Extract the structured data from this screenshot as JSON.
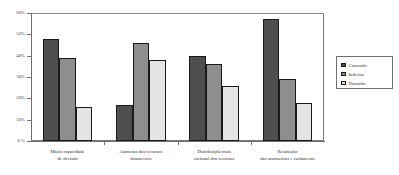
{
  "chart_data": {
    "type": "bar",
    "title": "",
    "xlabel": "",
    "ylabel": "",
    "ylim": [
      0,
      60
    ],
    "ytick_values": [
      0,
      10,
      20,
      30,
      40,
      50,
      60
    ],
    "ytick_labels": [
      "0 %",
      "10%",
      "20%",
      "30%",
      "40%",
      "50%",
      "60%"
    ],
    "grid": false,
    "legend_position": "right",
    "categories": [
      "Maior capacidade\nde decisão",
      "Aumento dos recursos\nfinanceiros",
      "Distribuição mais\nracional dos recursos",
      "Resolução\ndas assimetrias e isolamento"
    ],
    "category_lines": [
      [
        "Maior capacidade",
        "de decisão"
      ],
      [
        "Aumento dos recursos",
        "financeiros"
      ],
      [
        "Distribuição mais",
        "racional dos recursos"
      ],
      [
        "Resolução",
        "das assimetrias e isolamento"
      ]
    ],
    "series": [
      {
        "name": "Concordo",
        "color": "#4e4e4e",
        "values": [
          48,
          17,
          40,
          57
        ]
      },
      {
        "name": "Indeciso",
        "color": "#8e8e8e",
        "values": [
          39,
          46,
          36,
          29
        ]
      },
      {
        "name": "Discordo",
        "color": "#e4e4e4",
        "values": [
          16,
          38,
          26,
          18
        ]
      }
    ]
  },
  "legend": {
    "items": [
      {
        "label": "Concordo"
      },
      {
        "label": "Indeciso"
      },
      {
        "label": "Discordo"
      }
    ]
  }
}
